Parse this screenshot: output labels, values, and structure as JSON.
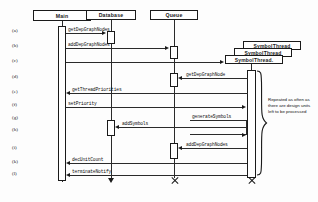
{
  "diagram": {
    "actors": [
      {
        "id": "main",
        "label": "Main",
        "x": 33,
        "y": 10,
        "w": 58,
        "h": 11,
        "cx": 62,
        "termination": "none"
      },
      {
        "id": "database",
        "label": "Database",
        "x": 86,
        "y": 10,
        "w": 50,
        "h": 10,
        "cx": 111,
        "termination": "arrow"
      },
      {
        "id": "queue",
        "label": "Queue",
        "x": 150,
        "y": 10,
        "w": 48,
        "h": 10,
        "cx": 174,
        "termination": "x"
      },
      {
        "id": "thread3",
        "label": "SymbolThread",
        "x": 243,
        "y": 41,
        "w": 58,
        "h": 9,
        "cx": 251,
        "termination": "none"
      },
      {
        "id": "thread2",
        "label": "SymbolThread",
        "x": 234,
        "y": 48,
        "w": 58,
        "h": 9,
        "cx": 251,
        "termination": "none"
      },
      {
        "id": "thread1",
        "label": "SymbolThread.",
        "x": 225,
        "y": 55,
        "w": 58,
        "h": 9,
        "cx": 251,
        "termination": "x"
      }
    ],
    "row_labels": [
      "(a)",
      "(b)",
      "(c)",
      "(d)",
      "(e)",
      "(f)",
      "(g)",
      "(h)",
      "(i)",
      "(k)",
      "(l)"
    ],
    "messages": [
      {
        "row": "(a)",
        "label": "getDepGraphNodes",
        "from": "main",
        "to": "database",
        "dir": "right"
      },
      {
        "row": "(b)",
        "label": "addDepGraphNodes",
        "from": "main",
        "to": "queue",
        "dir": "right"
      },
      {
        "row": "(c)",
        "label": "",
        "from": "main",
        "to": "thread1",
        "dir": "right"
      },
      {
        "row": "(d)",
        "label": "getDepGraphNode",
        "from": "thread1",
        "to": "queue",
        "dir": "left"
      },
      {
        "row": "(e)",
        "label": "getThreadPriorities",
        "from": "thread1",
        "to": "main",
        "dir": "left"
      },
      {
        "row": "(f)",
        "label": "setPriority",
        "from": "main",
        "to": "thread1",
        "dir": "right"
      },
      {
        "row": "(g)",
        "label": "generateSymbols",
        "from": "thread1",
        "to": "thread1",
        "dir": "self"
      },
      {
        "row": "(h)",
        "label": "addSymbols",
        "from": "thread1",
        "to": "database",
        "dir": "left"
      },
      {
        "row": "(i)",
        "label": "addDepGraphNodes",
        "from": "thread1",
        "to": "queue",
        "dir": "left"
      },
      {
        "row": "(k)",
        "label": "decUnitCount",
        "from": "thread1",
        "to": "main",
        "dir": "left"
      },
      {
        "row": "(l)",
        "label": "terminateNotify",
        "from": "thread1",
        "to": "main",
        "dir": "left"
      }
    ],
    "note": {
      "text": "Repeated as often as there are design units left to be processed"
    },
    "colors": {
      "stroke": "#1a1a1a",
      "background": "#ffffff",
      "text": "#111111"
    }
  }
}
